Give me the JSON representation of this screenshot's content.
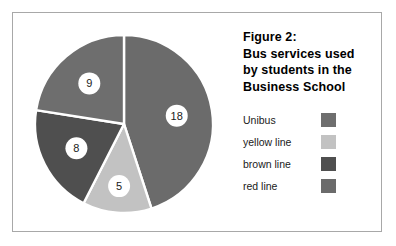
{
  "figure": {
    "title_lines": [
      "Figure 2:",
      "Bus services used",
      "by students in the",
      "Business School"
    ],
    "border_color": "#a8a8a8",
    "background_color": "#ffffff"
  },
  "chart_data": {
    "type": "pie",
    "title": "Figure 2: Bus services used by students in the Business School",
    "categories": [
      "Unibus",
      "yellow line",
      "brown line",
      "red line"
    ],
    "values": [
      9,
      5,
      8,
      18
    ],
    "total": 40,
    "labels": [
      "9",
      "5",
      "8",
      "18"
    ],
    "colors": [
      "#6e6e6e",
      "#c2c2c2",
      "#4f4f4f",
      "#6b6b6b"
    ],
    "legend_position": "right",
    "grid": false,
    "start_angle_deg": 0,
    "direction": "clockwise",
    "slice_order_clockwise": [
      "red line",
      "yellow line",
      "brown line",
      "Unibus"
    ],
    "separator_color": "#ffffff",
    "label_bubble_color": "#ffffff",
    "center_x": 111,
    "center_y": 111,
    "radius": 89
  },
  "legend": {
    "entries": [
      {
        "label": "Unibus",
        "color": "#6e6e6e"
      },
      {
        "label": "yellow line",
        "color": "#c2c2c2"
      },
      {
        "label": "brown line",
        "color": "#4f4f4f"
      },
      {
        "label": "red line",
        "color": "#6b6b6b"
      }
    ]
  }
}
